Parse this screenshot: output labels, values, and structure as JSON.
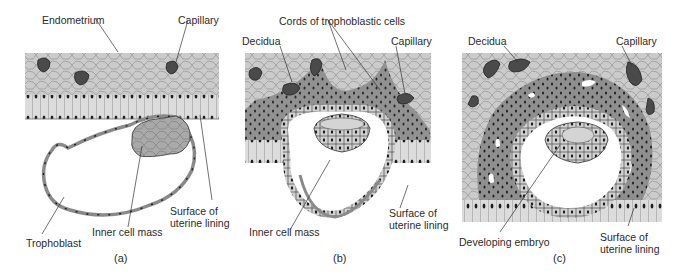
{
  "figure": {
    "panels": [
      {
        "id": "a",
        "letter": "(a)",
        "labels": {
          "endometrium": "Endometrium",
          "capillary": "Capillary",
          "trophoblast": "Trophoblast",
          "inner_cell_mass": "Inner cell mass",
          "surface": "Surface of uterine lining"
        }
      },
      {
        "id": "b",
        "letter": "(b)",
        "labels": {
          "cords": "Cords of trophoblastic cells",
          "decidua": "Decidua",
          "capillary": "Capillary",
          "inner_cell_mass": "Inner cell mass",
          "surface": "Surface of uterine lining"
        }
      },
      {
        "id": "c",
        "letter": "(c)",
        "labels": {
          "decidua": "Decidua",
          "capillary": "Capillary",
          "developing_embryo": "Developing embryo",
          "surface": "Surface of uterine lining"
        }
      }
    ],
    "colors": {
      "endometrium_fill": "#c8c8c8",
      "cell_outline": "#8a8a8a",
      "dark_tissue": "#8f8f8f",
      "capillary": "#4a4a4a",
      "nucleus": "#1e1e1e",
      "trophoblast_fill": "#9a9a9a",
      "line": "#333333"
    }
  }
}
